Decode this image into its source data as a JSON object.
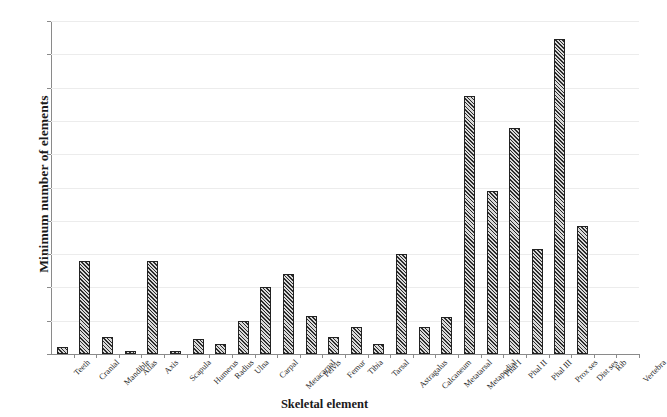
{
  "chart_data": {
    "type": "bar",
    "title": "",
    "xlabel": "Skeletal element",
    "ylabel": "Minimum number of elements",
    "ylim": [
      0,
      200
    ],
    "ytick_step": 20,
    "yticks": [
      0,
      20,
      40,
      60,
      80,
      100,
      120,
      140,
      160,
      180,
      200
    ],
    "grid": true,
    "legend": false,
    "categories": [
      "Teeth",
      "Cranial",
      "Mandible",
      "Atlas",
      "Axis",
      "Scapula",
      "Humerus",
      "Radius",
      "Ulna",
      "Carpal",
      "Metacarpal",
      "Pelvis",
      "Femur",
      "Tibia",
      "Tarsal",
      "Astragalus",
      "Calcaneum",
      "Metatarsal",
      "Metapodial",
      "Phal I",
      "Phal II",
      "Phal III",
      "Prox ses",
      "Dist ses",
      "Rib",
      "Vertebra"
    ],
    "values": [
      4,
      56,
      10,
      2,
      56,
      2,
      9,
      6,
      20,
      40,
      48,
      23,
      10,
      16,
      6,
      60,
      16,
      22,
      155,
      98,
      136,
      63,
      189,
      77,
      0,
      0
    ],
    "bar_fill": "hatched-diagonal",
    "bar_edge_color": "#222222",
    "grid_color": "#ececec",
    "axis_color": "#8a8a8a"
  }
}
